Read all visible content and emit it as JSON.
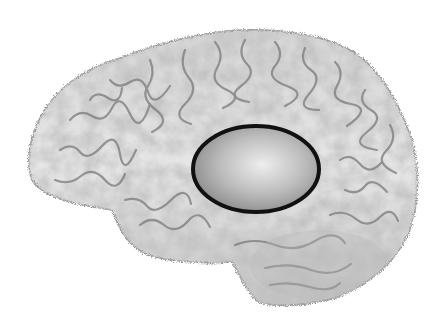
{
  "figure": {
    "background_color": "#ffffff",
    "brain": {
      "view": "left lateral",
      "base_color": "#c9c9c9",
      "light_color": "#f2f2f2",
      "sulci_color": "#7a7a7a"
    },
    "highlight": {
      "shape": "ellipse",
      "cx": 256,
      "cy": 169,
      "rx": 63,
      "ry": 43,
      "stroke_color": "#111111",
      "stroke_width": 4,
      "fill_center": "#eeeeee",
      "fill_edge": "#8a8a8a"
    }
  }
}
